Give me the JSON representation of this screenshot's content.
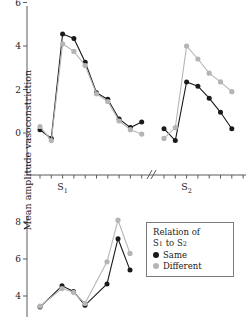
{
  "figure": {
    "ylabel": "Mean amplitude vasoconstriction"
  },
  "legend": {
    "title_line1": "Relation of",
    "title_line2_pre": "S",
    "title_line2_sub1": "1",
    "title_line2_mid": " to S",
    "title_line2_sub2": "2",
    "items": [
      {
        "label": "Same",
        "color": "#1a1a1a"
      },
      {
        "label": "Different",
        "color": "#b5b5b5"
      }
    ]
  },
  "chart_data": [
    {
      "type": "line",
      "panel": "top",
      "title": "",
      "xlabel": "",
      "ylabel": "Mean amplitude vasoconstriction",
      "ylim": [
        -1.2,
        6
      ],
      "yticks": [
        0,
        2,
        4,
        6
      ],
      "ytick_labels": [
        "0",
        "2",
        "4",
        "6"
      ],
      "grid": false,
      "axis_break": true,
      "axis_break_position": 0.555,
      "x_category_labels": [
        "S1",
        "S2"
      ],
      "x_category_label_text": [
        "S",
        "S"
      ],
      "x_category_subscripts": [
        "1",
        "2"
      ],
      "legend_position": "outside-bottom-right",
      "x": [
        1,
        2,
        3,
        4,
        5,
        6,
        7,
        8,
        9,
        10,
        11,
        12,
        13,
        14,
        15,
        16,
        17,
        18
      ],
      "series": [
        {
          "name": "Same",
          "color": "#1a1a1a",
          "values": [
            0.15,
            -0.25,
            4.55,
            4.35,
            3.25,
            1.85,
            1.55,
            0.65,
            0.25,
            0.5,
            null,
            0.2,
            -0.35,
            2.35,
            2.15,
            1.6,
            0.95,
            0.2
          ]
        },
        {
          "name": "Different",
          "color": "#b5b5b5",
          "values": [
            0.3,
            -0.35,
            4.1,
            3.75,
            3.1,
            1.8,
            1.45,
            0.55,
            0.15,
            -0.05,
            null,
            -0.25,
            0.25,
            4.0,
            3.4,
            2.75,
            2.35,
            1.9
          ]
        }
      ]
    },
    {
      "type": "line",
      "panel": "bottom",
      "title": "",
      "xlabel": "",
      "ylabel": "Mean amplitude vasoconstriction",
      "ylim": [
        3.1,
        8.6
      ],
      "yticks": [
        4,
        6,
        8
      ],
      "ytick_labels": [
        "4",
        "6",
        "8"
      ],
      "grid": false,
      "clipped_at_image_edge": true,
      "x": [
        1,
        2,
        3,
        4,
        5,
        6,
        7
      ],
      "series": [
        {
          "name": "Same",
          "color": "#1a1a1a",
          "values": [
            3.4,
            4.55,
            4.25,
            3.5,
            4.65,
            7.1,
            5.4
          ]
        },
        {
          "name": "Different",
          "color": "#b5b5b5",
          "values": [
            3.45,
            4.4,
            4.2,
            3.6,
            5.85,
            8.1,
            6.3
          ]
        }
      ]
    }
  ]
}
